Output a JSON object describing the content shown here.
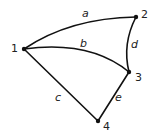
{
  "graph": {
    "title": "",
    "nodes": [
      {
        "id": "1",
        "label": "1"
      },
      {
        "id": "2",
        "label": "2"
      },
      {
        "id": "3",
        "label": "3"
      },
      {
        "id": "4",
        "label": "4"
      }
    ],
    "edges": [
      {
        "id": "a",
        "label": "a",
        "from": "1",
        "to": "2",
        "curved": true
      },
      {
        "id": "b",
        "label": "b",
        "from": "1",
        "to": "3",
        "curved": true
      },
      {
        "id": "c",
        "label": "c",
        "from": "1",
        "to": "4",
        "curved": false
      },
      {
        "id": "d",
        "label": "d",
        "from": "2",
        "to": "3",
        "curved": true
      },
      {
        "id": "e",
        "label": "e",
        "from": "3",
        "to": "4",
        "curved": false
      }
    ],
    "colors": {
      "stroke": "#111111",
      "background": "#ffffff"
    }
  }
}
